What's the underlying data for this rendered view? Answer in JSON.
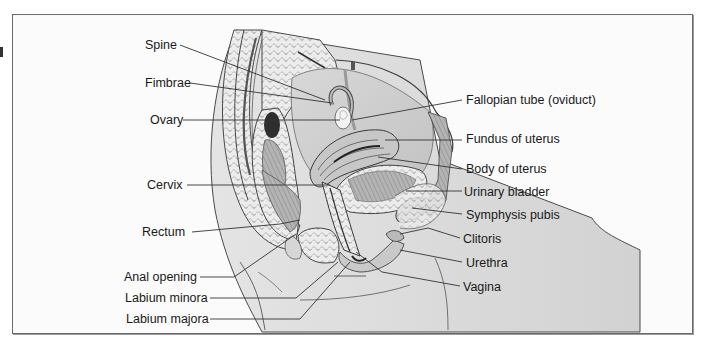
{
  "figure": {
    "labels_left": [
      {
        "id": "spine",
        "text": "Spine",
        "x": 145,
        "y": 38
      },
      {
        "id": "fimbrae",
        "text": "Fimbrae",
        "x": 145,
        "y": 76
      },
      {
        "id": "ovary",
        "text": "Ovary",
        "x": 150,
        "y": 113
      },
      {
        "id": "cervix",
        "text": "Cervix",
        "x": 147,
        "y": 178
      },
      {
        "id": "rectum",
        "text": "Rectum",
        "x": 142,
        "y": 225
      },
      {
        "id": "anal-opening",
        "text": "Anal opening",
        "x": 124,
        "y": 270
      },
      {
        "id": "labium-minora",
        "text": "Labium minora",
        "x": 125,
        "y": 291
      },
      {
        "id": "labium-majora",
        "text": "Labium majora",
        "x": 126,
        "y": 312
      }
    ],
    "labels_right": [
      {
        "id": "fallopian-tube",
        "text": "Fallopian tube (oviduct)",
        "x": 466,
        "y": 93
      },
      {
        "id": "fundus-of-uterus",
        "text": "Fundus of uterus",
        "x": 466,
        "y": 132
      },
      {
        "id": "body-of-uterus",
        "text": "Body of uterus",
        "x": 466,
        "y": 162
      },
      {
        "id": "urinary-bladder",
        "text": "Urinary bladder",
        "x": 464,
        "y": 185
      },
      {
        "id": "symphysis-pubis",
        "text": "Symphysis pubis",
        "x": 466,
        "y": 208
      },
      {
        "id": "clitoris",
        "text": "Clitoris",
        "x": 463,
        "y": 232
      },
      {
        "id": "urethra",
        "text": "Urethra",
        "x": 466,
        "y": 256
      },
      {
        "id": "vagina",
        "text": "Vagina",
        "x": 463,
        "y": 280
      }
    ],
    "colors": {
      "frame": "#6a6a6a",
      "tissue_light": "#e9e9e9",
      "tissue_mid": "#bdbdbd",
      "tissue_dark": "#5a5a5a",
      "leader": "#333333",
      "text": "#1a1a1a"
    }
  }
}
